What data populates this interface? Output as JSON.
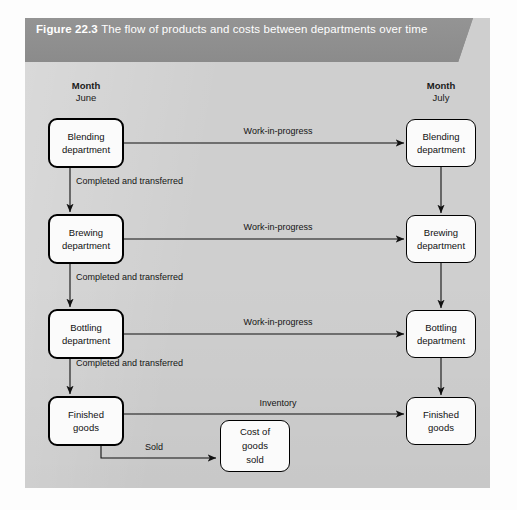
{
  "caption": {
    "figure_number": "Figure 22.3",
    "text": "The flow of products and costs between departments over time"
  },
  "columns": {
    "left": {
      "heading": "Month",
      "value": "June"
    },
    "right": {
      "heading": "Month",
      "value": "July"
    }
  },
  "nodes": {
    "left": [
      {
        "line1": "Blending",
        "line2": "department"
      },
      {
        "line1": "Brewing",
        "line2": "department"
      },
      {
        "line1": "Bottling",
        "line2": "department"
      },
      {
        "line1": "Finished",
        "line2": "goods"
      }
    ],
    "right": [
      {
        "line1": "Blending",
        "line2": "department"
      },
      {
        "line1": "Brewing",
        "line2": "department"
      },
      {
        "line1": "Bottling",
        "line2": "department"
      },
      {
        "line1": "Finished",
        "line2": "goods"
      }
    ],
    "cost_of_goods_sold": {
      "line1": "Cost of",
      "line2": "goods",
      "line3": "sold"
    }
  },
  "edges": {
    "work_in_progress_1": "Work-in-progress",
    "work_in_progress_2": "Work-in-progress",
    "work_in_progress_3": "Work-in-progress",
    "inventory": "Inventory",
    "completed_and_transferred_1": "Completed and transferred",
    "completed_and_transferred_2": "Completed and transferred",
    "completed_and_transferred_3": "Completed and transferred",
    "sold": "Sold"
  },
  "colors": {
    "panel_background": "#cfcfcf",
    "banner": "#8f8f8f",
    "banner_text": "#ffffff",
    "box_fill": "#fbfbfb",
    "box_border": "#000000",
    "connector": "#111111"
  }
}
